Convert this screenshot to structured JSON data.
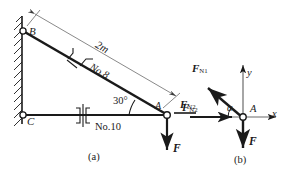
{
  "figure": {
    "panel_a": {
      "caption": "(a)",
      "joints": {
        "b": "B",
        "c": "C",
        "a": "A"
      },
      "dimension_label": "2m",
      "diagonal_member_label": "No.8",
      "horizontal_member_label": "No.10",
      "angle_label": "30°",
      "load_label": "F",
      "reaction_label": "F",
      "reaction_sub": "N2"
    },
    "panel_b": {
      "caption": "(b)",
      "origin_label": "A",
      "axis_x": "x",
      "axis_y": "y",
      "angle_label": "α",
      "force_n1": "F",
      "force_n1_sub": "N1",
      "force_n2": "F",
      "force_n2_sub": "N2",
      "force_load": "F"
    }
  },
  "colors": {
    "line": "#1a1a1a",
    "thin": "#5a5a5a",
    "background": "#ffffff"
  }
}
